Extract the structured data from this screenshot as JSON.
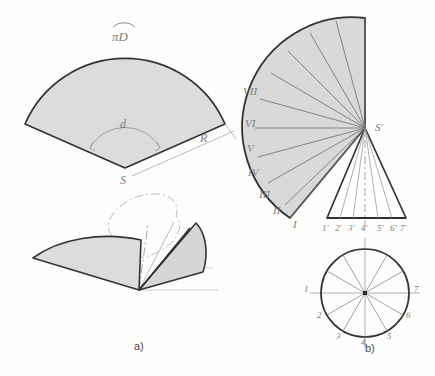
{
  "figure": {
    "title_a_caption": "a)",
    "title_b_caption": "b)",
    "panel_a": {
      "labels": {
        "arc_length": "πD",
        "angle": "d",
        "radius": "R",
        "apex": "S"
      },
      "description_sector": "developed cone sector",
      "description_pictorial": "pictorial view of cone unrolling"
    },
    "panel_b": {
      "apex_label": "S'",
      "roman_labels": [
        "I",
        "II",
        "III",
        "IV",
        "V",
        "VI",
        "VII"
      ],
      "base_labels": [
        "1'",
        "2'",
        "3'",
        "4'",
        "5'",
        "6'",
        "7'"
      ],
      "circle_labels": [
        "1",
        "2",
        "3",
        "4",
        "5",
        "6",
        "7"
      ],
      "description_development": "radial line development of cone",
      "description_elevation": "front elevation of cone",
      "description_plan": "plan circle divided into twelve parts"
    }
  },
  "style": {
    "fill_gray": "#d9d9d9",
    "outline_dark": "#3a3a3a",
    "line_light": "#8c8c8c",
    "line_faint": "#b8b8b8",
    "label_color": "#7d7d7d",
    "paper": "#fdfdfc"
  }
}
